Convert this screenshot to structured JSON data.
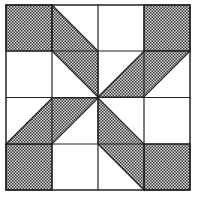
{
  "diagram": {
    "title": "",
    "type": "quilt-block",
    "pattern": "pinwheel-star",
    "colors": {
      "background": "#ffffff",
      "line": "#222222",
      "check_dark": "#3a3a3a",
      "check_light": "#d8d8d8"
    },
    "grid": {
      "rows": 4,
      "cols": 4
    }
  }
}
